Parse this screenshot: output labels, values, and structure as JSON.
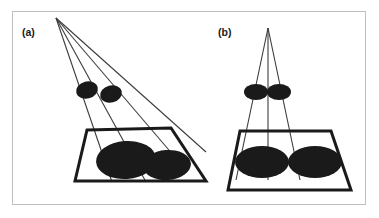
{
  "figure": {
    "width": 379,
    "height": 218,
    "background_color": "#ffffff",
    "frame_color": "#bfbfbf",
    "ink_color": "#1a1a1a",
    "blob_color": "#1a1a1a",
    "ray_color": "#3c3c3c",
    "caption_a": "(a)",
    "caption_b": "(b)"
  },
  "chart_data": {
    "type": "diagram",
    "title": "",
    "subtitle": "",
    "xlabel": "",
    "ylabel": "",
    "panels": [
      {
        "id": "a",
        "label": "(a)",
        "description": "Oblique point-source projection: rays from an off-axis apex cast two overlapping elliptical shadows onto a tilted ground plane.",
        "apex": {
          "x": 56,
          "y": 18
        },
        "ray_count": 4,
        "ray_endpoints": [
          {
            "x": 112,
            "y": 182
          },
          {
            "x": 146,
            "y": 182
          },
          {
            "x": 186,
            "y": 170
          },
          {
            "x": 206,
            "y": 152
          }
        ],
        "plane": {
          "shape": "parallelogram",
          "corners": [
            {
              "x": 87,
              "y": 130
            },
            {
              "x": 171,
              "y": 128
            },
            {
              "x": 206,
              "y": 181
            },
            {
              "x": 75,
              "y": 181
            }
          ],
          "stroke_width": 3
        },
        "source_blobs": [
          {
            "cx": 87,
            "cy": 90,
            "rx": 11,
            "ry": 8.5,
            "rotation": -14
          },
          {
            "cx": 111,
            "cy": 94,
            "rx": 11,
            "ry": 8.5,
            "rotation": -14
          }
        ],
        "shadow_blobs": [
          {
            "cx": 126,
            "cy": 160,
            "rx": 30,
            "ry": 19,
            "rotation": -4
          },
          {
            "cx": 167,
            "cy": 165,
            "rx": 24,
            "ry": 15,
            "rotation": -4
          }
        ],
        "shadows_separated": true
      },
      {
        "id": "b",
        "label": "(b)",
        "description": "Symmetric on-axis projection: rays from an overhead apex cast two side-by-side elliptical shadows onto a level ground plane.",
        "apex": {
          "x": 268,
          "y": 28
        },
        "ray_count": 3,
        "ray_endpoints": [
          {
            "x": 236,
            "y": 180
          },
          {
            "x": 268,
            "y": 180
          },
          {
            "x": 300,
            "y": 180
          }
        ],
        "plane": {
          "shape": "trapezoid",
          "corners": [
            {
              "x": 240,
              "y": 131
            },
            {
              "x": 331,
              "y": 131
            },
            {
              "x": 351,
              "y": 190
            },
            {
              "x": 228,
              "y": 190
            }
          ],
          "stroke_width": 3
        },
        "source_blobs": [
          {
            "cx": 256,
            "cy": 92,
            "rx": 12,
            "ry": 8,
            "rotation": 0
          },
          {
            "cx": 279,
            "cy": 92,
            "rx": 12,
            "ry": 8,
            "rotation": 0
          }
        ],
        "shadow_blobs": [
          {
            "cx": 262,
            "cy": 162,
            "rx": 27,
            "ry": 16,
            "rotation": 0
          },
          {
            "cx": 315,
            "cy": 162,
            "rx": 27,
            "ry": 16,
            "rotation": 0
          }
        ],
        "shadows_separated": false
      }
    ]
  }
}
